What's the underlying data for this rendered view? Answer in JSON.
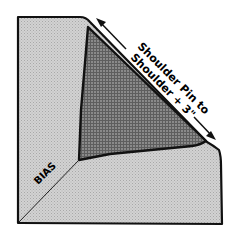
{
  "diagram": {
    "labels": {
      "bias": "BIAS",
      "measure_line1": "Shoulder Pin to",
      "measure_line2": "Shoulder + 3\""
    },
    "colors": {
      "fabric_light": "#c8c8c8",
      "fabric_dark": "#7a7a7a",
      "outline": "#111111",
      "background": "#ffffff"
    }
  }
}
